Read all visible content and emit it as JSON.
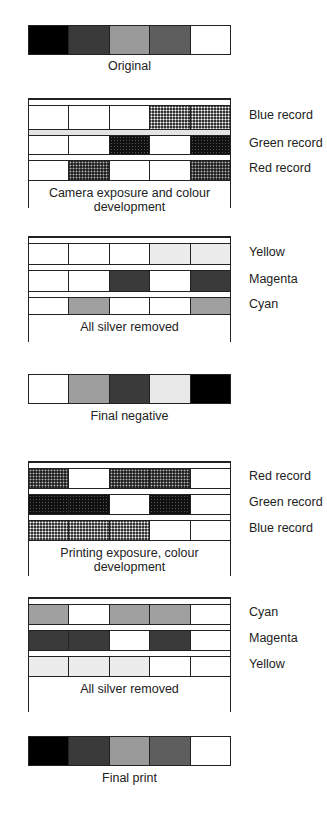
{
  "colors": {
    "black": "#000000",
    "dark": "#3a3a3a",
    "mid_light": "#9a9a9a",
    "mid_dark": "#5e5e5e",
    "white": "#ffffff",
    "yellow_dye": "#ececec",
    "magenta_dye": "#3a3a3a",
    "cyan_dye": "#a0a0a0"
  },
  "original": {
    "caption": "Original",
    "patches": [
      "#000000",
      "#3a3a3a",
      "#9a9a9a",
      "#5e5e5e",
      "#ffffff"
    ]
  },
  "camera": {
    "caption": "Camera exposure and colour development",
    "layers": [
      {
        "label": "Blue record",
        "cells": [
          "white",
          "white",
          "white",
          "dot-light",
          "dot-light"
        ]
      },
      {
        "label": "Green record",
        "cells": [
          "white",
          "white",
          "dot-dark",
          "white",
          "dot-dark"
        ]
      },
      {
        "label": "Red record",
        "cells": [
          "white",
          "dot-mid",
          "white",
          "white",
          "dot-mid"
        ]
      }
    ]
  },
  "negative_dyes": {
    "caption": "All silver removed",
    "layers": [
      {
        "label": "Yellow",
        "cells": [
          "white",
          "white",
          "white",
          "yellow",
          "yellow"
        ]
      },
      {
        "label": "Magenta",
        "cells": [
          "white",
          "white",
          "magenta",
          "white",
          "magenta"
        ]
      },
      {
        "label": "Cyan",
        "cells": [
          "white",
          "cyan",
          "white",
          "white",
          "cyan"
        ]
      }
    ]
  },
  "final_negative": {
    "caption": "Final negative",
    "patches": [
      "#ffffff",
      "#9e9e9e",
      "#3a3a3a",
      "#e8e8e8",
      "#000000"
    ]
  },
  "printing": {
    "caption": "Printing exposure, colour development",
    "layers": [
      {
        "label": "Red record",
        "cells": [
          "dot-mid",
          "white",
          "dot-mid",
          "dot-mid",
          "white"
        ]
      },
      {
        "label": "Green record",
        "cells": [
          "dot-dark",
          "dot-dark",
          "white",
          "dot-dark",
          "white"
        ]
      },
      {
        "label": "Blue record",
        "cells": [
          "dot-light",
          "dot-light",
          "dot-light",
          "white",
          "white"
        ]
      }
    ]
  },
  "print_dyes": {
    "caption": "All silver removed",
    "layers": [
      {
        "label": "Cyan",
        "cells": [
          "cyan",
          "white",
          "cyan",
          "cyan",
          "white"
        ]
      },
      {
        "label": "Magenta",
        "cells": [
          "magenta",
          "magenta",
          "white",
          "magenta",
          "white"
        ]
      },
      {
        "label": "Yellow",
        "cells": [
          "yellow",
          "yellow",
          "yellow",
          "white",
          "white"
        ]
      }
    ]
  },
  "final_print": {
    "caption": "Final print",
    "patches": [
      "#000000",
      "#3a3a3a",
      "#9a9a9a",
      "#5e5e5e",
      "#ffffff"
    ]
  }
}
